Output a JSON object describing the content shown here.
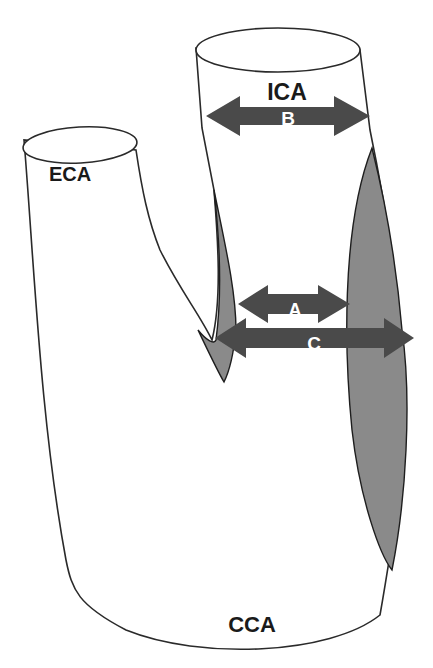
{
  "diagram": {
    "vessels": {
      "ica": "ICA",
      "eca": "ECA",
      "cca": "CCA"
    },
    "measurements": {
      "a": "A",
      "b": "B",
      "c": "C"
    },
    "colors": {
      "background": "#ffffff",
      "outline": "#2a2a2a",
      "plaque": "#8a8a8a",
      "arrow": "#4a4a4a",
      "label_dark": "#1a1a1a",
      "label_light": "#ffffff"
    }
  }
}
